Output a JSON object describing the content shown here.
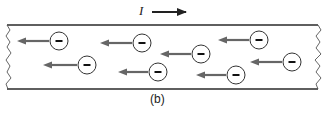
{
  "figure": {
    "caption": "(b)",
    "current": {
      "label": "I",
      "direction": "right",
      "arrow": {
        "x1": 152,
        "y1": 12,
        "x2": 186,
        "y2": 12
      }
    },
    "wire": {
      "top_y": 25,
      "bottom_y": 89,
      "left_x": 7,
      "right_x": 318,
      "line_color": "#2a2a2a",
      "end_style": "jagged-break"
    },
    "charge_carriers": {
      "sign": "−",
      "type": "electron",
      "drift_direction": "left",
      "circle_radius": 9,
      "arrow_color": "#666666",
      "items": [
        {
          "cx": 59,
          "cy": 41,
          "arrow_from": 49,
          "arrow_to": 17
        },
        {
          "cx": 142,
          "cy": 43,
          "arrow_from": 132,
          "arrow_to": 100
        },
        {
          "cx": 201,
          "cy": 54,
          "arrow_from": 191,
          "arrow_to": 160
        },
        {
          "cx": 259,
          "cy": 40,
          "arrow_from": 249,
          "arrow_to": 218
        },
        {
          "cx": 87,
          "cy": 65,
          "arrow_from": 77,
          "arrow_to": 43
        },
        {
          "cx": 158,
          "cy": 72,
          "arrow_from": 148,
          "arrow_to": 118
        },
        {
          "cx": 236,
          "cy": 75,
          "arrow_from": 226,
          "arrow_to": 196
        },
        {
          "cx": 292,
          "cy": 62,
          "arrow_from": 282,
          "arrow_to": 250
        }
      ]
    }
  }
}
